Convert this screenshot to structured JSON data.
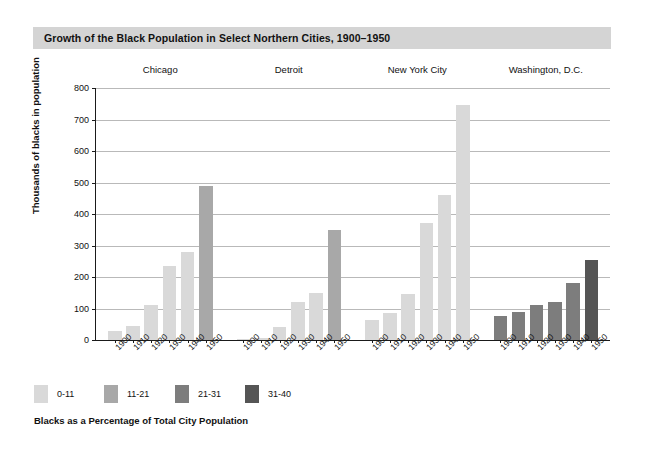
{
  "title": "Growth of the Black Population in Select Northern Cities, 1900–1950",
  "legend_caption": "Blacks as a Percentage of Total City Population",
  "colors": {
    "band": "#d4d4d4",
    "grid": "#b9b9b9",
    "axis": "#1a1a1a",
    "bin_0_11": "#d9d9d9",
    "bin_11_21": "#a8a8a8",
    "bin_21_31": "#7d7d7d",
    "bin_31_40": "#555555"
  },
  "chart_data": {
    "type": "bar",
    "title": "Growth of the Black Population in Select Northern Cities, 1900–1950",
    "xlabel": "",
    "ylabel": "Thousands of blacks in population",
    "ylim": [
      0,
      800
    ],
    "yticks": [
      0,
      100,
      200,
      300,
      400,
      500,
      600,
      700,
      800
    ],
    "ytick_labels": [
      "0",
      "100",
      "200",
      "300",
      "400",
      "500",
      "600",
      "700",
      "800"
    ],
    "grid": true,
    "legend_position": "below-axes-left",
    "legend_title": "Blacks as a Percentage of Total City Population",
    "legend_entries": [
      {
        "label": "0-11",
        "color": "#d9d9d9"
      },
      {
        "label": "11-21",
        "color": "#a8a8a8"
      },
      {
        "label": "21-31",
        "color": "#7d7d7d"
      },
      {
        "label": "31-40",
        "color": "#555555"
      }
    ],
    "categories": [
      "1900",
      "1910",
      "1920",
      "1930",
      "1940",
      "1950"
    ],
    "groups": [
      {
        "name": "Chicago",
        "bars": [
          {
            "year": "1900",
            "value": 30,
            "bin": "0-11"
          },
          {
            "year": "1910",
            "value": 45,
            "bin": "0-11"
          },
          {
            "year": "1920",
            "value": 110,
            "bin": "0-11"
          },
          {
            "year": "1930",
            "value": 235,
            "bin": "0-11"
          },
          {
            "year": "1940",
            "value": 278,
            "bin": "0-11"
          },
          {
            "year": "1950",
            "value": 490,
            "bin": "11-21"
          }
        ]
      },
      {
        "name": "Detroit",
        "bars": [
          {
            "year": "1900",
            "value": 4,
            "bin": "0-11"
          },
          {
            "year": "1910",
            "value": 6,
            "bin": "0-11"
          },
          {
            "year": "1920",
            "value": 41,
            "bin": "0-11"
          },
          {
            "year": "1930",
            "value": 120,
            "bin": "0-11"
          },
          {
            "year": "1940",
            "value": 150,
            "bin": "0-11"
          },
          {
            "year": "1950",
            "value": 350,
            "bin": "11-21"
          }
        ]
      },
      {
        "name": "New York City",
        "bars": [
          {
            "year": "1900",
            "value": 62,
            "bin": "0-11"
          },
          {
            "year": "1910",
            "value": 85,
            "bin": "0-11"
          },
          {
            "year": "1920",
            "value": 145,
            "bin": "0-11"
          },
          {
            "year": "1930",
            "value": 370,
            "bin": "0-11"
          },
          {
            "year": "1940",
            "value": 460,
            "bin": "0-11"
          },
          {
            "year": "1950",
            "value": 745,
            "bin": "0-11"
          }
        ]
      },
      {
        "name": "Washington, D.C.",
        "bars": [
          {
            "year": "1900",
            "value": 75,
            "bin": "21-31"
          },
          {
            "year": "1910",
            "value": 90,
            "bin": "21-31"
          },
          {
            "year": "1920",
            "value": 112,
            "bin": "21-31"
          },
          {
            "year": "1930",
            "value": 120,
            "bin": "21-31"
          },
          {
            "year": "1940",
            "value": 180,
            "bin": "21-31"
          },
          {
            "year": "1950",
            "value": 255,
            "bin": "31-40"
          }
        ]
      }
    ]
  }
}
